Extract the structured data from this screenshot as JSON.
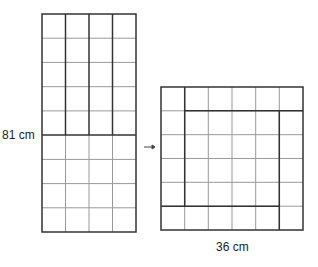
{
  "left_rectangle": {
    "height_label": "81 cm",
    "columns": 4,
    "rows": 9
  },
  "arrow": {
    "glyph": "→"
  },
  "right_square": {
    "width_label": "36 cm",
    "columns": 6,
    "rows": 6
  },
  "colors": {
    "thick_line": "#333333",
    "thin_line": "#999999"
  }
}
